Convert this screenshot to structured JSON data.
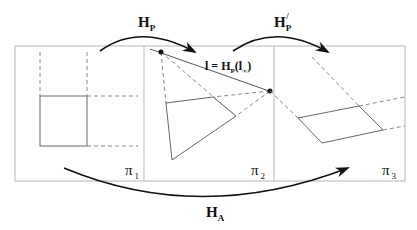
{
  "labels": {
    "hp": "H",
    "hp_sub": "P",
    "hp_prime": "H",
    "hp_prime_sub": "P",
    "hp_prime_sup": "/",
    "ha": "H",
    "ha_sub": "A",
    "line_label_l": "l = H",
    "line_label_sub": "P",
    "line_label_arg": "(l",
    "line_label_arg_sub": "∞",
    "line_label_close": ")",
    "pi": "π",
    "pi1_sub": "1",
    "pi2_sub": "2",
    "pi3_sub": "3"
  },
  "colors": {
    "frame": "#b5b5b5",
    "shape": "#555555",
    "dash": "#8a8a8a",
    "arrow": "#111111"
  }
}
